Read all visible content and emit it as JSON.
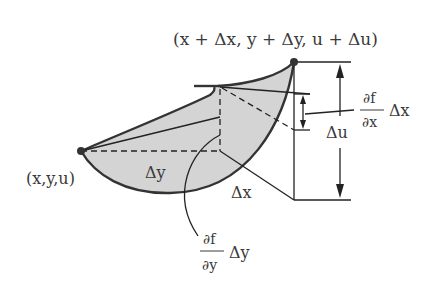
{
  "diagram": {
    "colors": {
      "surface_fill": "#d4d4d4",
      "stroke": "#333333",
      "text": "#3a3a3a",
      "background": "#ffffff"
    },
    "points": {
      "start": {
        "label": "(x,y,u)"
      },
      "end": {
        "label": "(x + Δx, y + Δy, u + Δu)"
      }
    },
    "labels": {
      "delta_y": "Δy",
      "delta_x": "Δx",
      "delta_u": "Δu",
      "partial_x": {
        "numerator": "∂f",
        "denominator": "∂x",
        "factor": "Δx"
      },
      "partial_y": {
        "numerator": "∂f",
        "denominator": "∂y",
        "factor": "Δy"
      }
    }
  }
}
